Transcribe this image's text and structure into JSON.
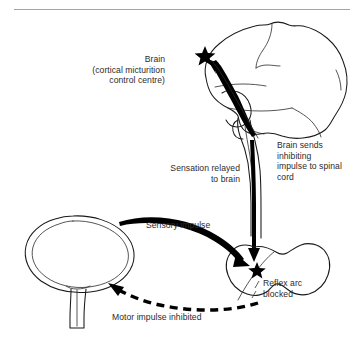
{
  "figure": {
    "background_color": "#ffffff",
    "ink_color": "#1a1a1a",
    "rule_color": "#9a9a9a"
  },
  "labels": {
    "brain": "Brain\n(cortical micturition\ncontrol centre)",
    "sensation_relayed": "Sensation relayed\nto brain",
    "brain_sends": "Brain sends\ninhibiting\nimpulse to spinal\ncord",
    "sensory_impulse": "Sensory impulse",
    "reflex_arc": "Reflex arc\nblocked",
    "motor_impulse": "Motor impulse inhibited"
  },
  "structures": {
    "brain": "brain-lateral-view",
    "brainstem": "brainstem-spinal-tract",
    "bladder": "urinary-bladder",
    "urethra": "urethra",
    "spinal_cord": "spinal-cord-cross-section"
  },
  "markers": {
    "cortex_star": "star-marker",
    "spinal_star": "star-marker"
  },
  "arrows": {
    "ascending": "sensation-to-brain-arrow",
    "descending": "inhibiting-impulse-arrow",
    "sensory": "sensory-impulse-arrow",
    "motor": "motor-impulse-dashed-arrow"
  }
}
